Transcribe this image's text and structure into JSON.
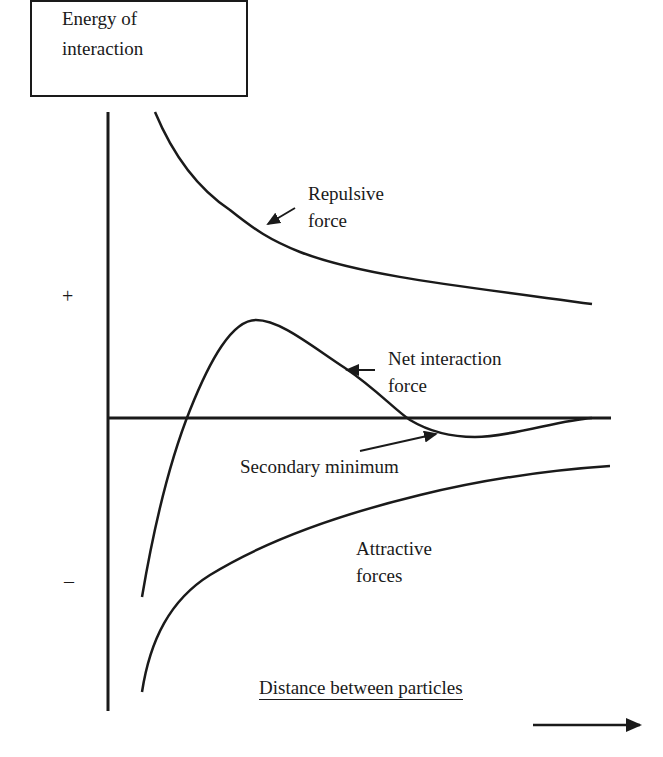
{
  "diagram": {
    "title_box": {
      "line1": "Energy of",
      "line2": "interaction"
    },
    "y_axis": {
      "positive_marker": "+",
      "negative_marker": "–"
    },
    "x_axis": {
      "label": "Distance between particles",
      "direction": "increasing to the right"
    },
    "curves": [
      {
        "name": "Repulsive force",
        "label_line1": "Repulsive",
        "label_line2": "force"
      },
      {
        "name": "Net interaction force",
        "label_line1": "Net interaction",
        "label_line2": "force"
      },
      {
        "name": "Attractive forces",
        "label_line1": "Attractive",
        "label_line2": "forces"
      }
    ],
    "annotations": {
      "secondary_minimum": "Secondary minimum"
    },
    "colors": {
      "line": "#1a1a1a",
      "background": "#ffffff"
    }
  }
}
